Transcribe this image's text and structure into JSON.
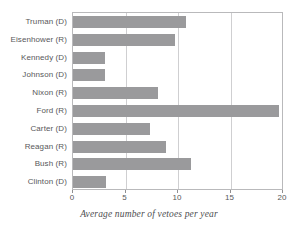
{
  "chart_data": {
    "type": "bar",
    "orientation": "horizontal",
    "title": "",
    "xlabel": "Average number of vetoes per year",
    "ylabel": "",
    "categories": [
      "Truman (D)",
      "Eisenhower (R)",
      "Kennedy (D)",
      "Johnson (D)",
      "Nixon (R)",
      "Ford (R)",
      "Carter (D)",
      "Reagan (R)",
      "Bush (R)",
      "Clinton (D)"
    ],
    "values": [
      10.8,
      9.7,
      3.0,
      3.0,
      8.1,
      19.6,
      7.3,
      8.9,
      11.2,
      3.1
    ],
    "xlim": [
      0,
      20
    ],
    "xticks": [
      0,
      5,
      10,
      15,
      20
    ],
    "xticklabels": [
      "0",
      "5",
      "10",
      "15",
      "20"
    ],
    "gridlines": [
      5,
      10,
      15
    ],
    "grid": true,
    "legend": false,
    "bar_color": "#9a9a9c",
    "grid_color": "#cfcfd1",
    "frame_color": "#b9b9bb",
    "text_color": "#58585a"
  }
}
